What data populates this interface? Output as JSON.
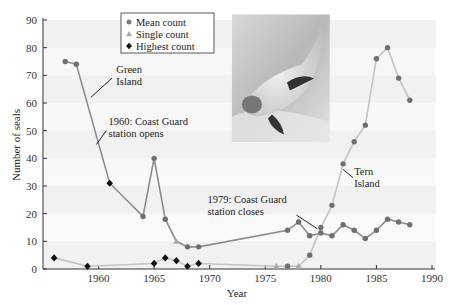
{
  "chart_data": {
    "type": "line",
    "title": "",
    "xlabel": "Year",
    "ylabel": "Number of seals",
    "xlim": [
      1955,
      1990
    ],
    "ylim": [
      0,
      90
    ],
    "x_ticks": [
      1960,
      1965,
      1970,
      1975,
      1980,
      1985,
      1990
    ],
    "y_ticks": [
      0,
      10,
      20,
      30,
      40,
      50,
      60,
      70,
      80,
      90
    ],
    "grid": false,
    "legend_position": "top-center",
    "legend": [
      {
        "label": "Mean count",
        "marker": "circle",
        "color": "#777777"
      },
      {
        "label": "Single count",
        "marker": "triangle",
        "color": "#aaaaaa"
      },
      {
        "label": "Highest count",
        "marker": "diamond",
        "color": "#111111"
      }
    ],
    "series": [
      {
        "name": "Green Island",
        "line_color": "#8c8c8c",
        "points": [
          {
            "x": 1957,
            "y": 75,
            "type": "mean"
          },
          {
            "x": 1958,
            "y": 74,
            "type": "mean"
          },
          {
            "x": 1961,
            "y": 31,
            "type": "highest"
          },
          {
            "x": 1964,
            "y": 19,
            "type": "mean"
          },
          {
            "x": 1965,
            "y": 40,
            "type": "mean"
          },
          {
            "x": 1966,
            "y": 18,
            "type": "mean"
          },
          {
            "x": 1967,
            "y": 10,
            "type": "single"
          },
          {
            "x": 1968,
            "y": 8,
            "type": "mean"
          },
          {
            "x": 1969,
            "y": 8,
            "type": "mean"
          },
          {
            "x": 1977,
            "y": 14,
            "type": "mean"
          },
          {
            "x": 1978,
            "y": 17,
            "type": "mean"
          },
          {
            "x": 1979,
            "y": 12,
            "type": "mean"
          },
          {
            "x": 1980,
            "y": 13,
            "type": "mean"
          },
          {
            "x": 1981,
            "y": 12,
            "type": "mean"
          },
          {
            "x": 1982,
            "y": 16,
            "type": "mean"
          },
          {
            "x": 1983,
            "y": 14,
            "type": "mean"
          },
          {
            "x": 1984,
            "y": 11,
            "type": "mean"
          },
          {
            "x": 1985,
            "y": 14,
            "type": "mean"
          },
          {
            "x": 1986,
            "y": 18,
            "type": "mean"
          },
          {
            "x": 1987,
            "y": 17,
            "type": "mean"
          },
          {
            "x": 1988,
            "y": 16,
            "type": "mean"
          }
        ]
      },
      {
        "name": "Tern Island",
        "line_color": "#c4c4c4",
        "points": [
          {
            "x": 1956,
            "y": 4,
            "type": "highest"
          },
          {
            "x": 1959,
            "y": 1,
            "type": "highest"
          },
          {
            "x": 1965,
            "y": 2,
            "type": "highest"
          },
          {
            "x": 1966,
            "y": 4,
            "type": "highest"
          },
          {
            "x": 1967,
            "y": 3,
            "type": "highest"
          },
          {
            "x": 1968,
            "y": 1,
            "type": "highest"
          },
          {
            "x": 1969,
            "y": 2,
            "type": "highest"
          },
          {
            "x": 1976,
            "y": 1,
            "type": "single"
          },
          {
            "x": 1977,
            "y": 1,
            "type": "mean"
          },
          {
            "x": 1978,
            "y": 1,
            "type": "single"
          },
          {
            "x": 1979,
            "y": 5,
            "type": "mean"
          },
          {
            "x": 1980,
            "y": 15,
            "type": "mean"
          },
          {
            "x": 1981,
            "y": 23,
            "type": "mean"
          },
          {
            "x": 1982,
            "y": 38,
            "type": "mean"
          },
          {
            "x": 1983,
            "y": 46,
            "type": "mean"
          },
          {
            "x": 1984,
            "y": 52,
            "type": "mean"
          },
          {
            "x": 1985,
            "y": 76,
            "type": "mean"
          },
          {
            "x": 1986,
            "y": 80,
            "type": "mean"
          },
          {
            "x": 1987,
            "y": 69,
            "type": "mean"
          },
          {
            "x": 1988,
            "y": 61,
            "type": "mean"
          }
        ]
      }
    ],
    "annotations": [
      {
        "lines": [
          "Green",
          "Island"
        ],
        "text_x": 1961.6,
        "text_y": 71,
        "pointer_from": [
          1961.2,
          69
        ],
        "pointer_to": [
          1959.3,
          62
        ]
      },
      {
        "lines": [
          "1960: Coast Guard",
          "station opens"
        ],
        "text_x": 1960.9,
        "text_y": 52,
        "pointer_from": [
          1960.7,
          50
        ],
        "pointer_to": [
          1959.8,
          45
        ]
      },
      {
        "lines": [
          "1979: Coast Guard",
          "station closes"
        ],
        "text_x": 1969.8,
        "text_y": 24,
        "pointer_from": [
          1977.8,
          19.5
        ],
        "pointer_to": [
          1979.7,
          14.5
        ]
      },
      {
        "lines": [
          "Tern",
          "Island"
        ],
        "text_x": 1983.0,
        "text_y": 34,
        "pointer_from": [
          1982.9,
          33
        ],
        "pointer_to": [
          1982.0,
          36
        ]
      }
    ],
    "image": {
      "description": "photo of a monk seal swimming underwater",
      "x_range": [
        1972.0,
        1980.8
      ],
      "y_range": [
        46,
        92
      ]
    }
  }
}
